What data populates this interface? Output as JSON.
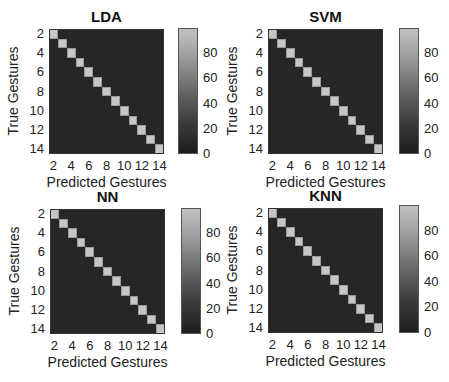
{
  "chart_data": [
    {
      "type": "heatmap",
      "title": "LDA",
      "xlabel": "Predicted Gestures",
      "ylabel": "True Gestures",
      "x_ticks": [
        "2",
        "4",
        "6",
        "8",
        "10",
        "12",
        "14"
      ],
      "y_ticks": [
        "2",
        "4",
        "6",
        "8",
        "10",
        "12",
        "14"
      ],
      "n_classes": 14,
      "diagonal_values": [
        100,
        100,
        100,
        100,
        100,
        100,
        100,
        100,
        100,
        100,
        100,
        100,
        100,
        100
      ],
      "off_diagonal_value": 0,
      "colorbar": {
        "ticks": [
          "0",
          "20",
          "40",
          "60",
          "80"
        ],
        "range": [
          0,
          100
        ]
      }
    },
    {
      "type": "heatmap",
      "title": "SVM",
      "xlabel": "Predicted Gestures",
      "ylabel": "True Gestures",
      "x_ticks": [
        "2",
        "4",
        "6",
        "8",
        "10",
        "12",
        "14"
      ],
      "y_ticks": [
        "2",
        "4",
        "6",
        "8",
        "10",
        "12",
        "14"
      ],
      "n_classes": 14,
      "diagonal_values": [
        100,
        100,
        100,
        100,
        100,
        100,
        100,
        100,
        100,
        100,
        100,
        100,
        100,
        100
      ],
      "off_diagonal_value": 0,
      "colorbar": {
        "ticks": [
          "0",
          "20",
          "40",
          "60",
          "80"
        ],
        "range": [
          0,
          100
        ]
      }
    },
    {
      "type": "heatmap",
      "title": "NN",
      "xlabel": "Predicted Gestures",
      "ylabel": "True Gestures",
      "x_ticks": [
        "2",
        "4",
        "6",
        "8",
        "10",
        "12",
        "14"
      ],
      "y_ticks": [
        "2",
        "4",
        "6",
        "8",
        "10",
        "12",
        "14"
      ],
      "n_classes": 14,
      "diagonal_values": [
        100,
        100,
        100,
        100,
        100,
        100,
        100,
        100,
        100,
        100,
        100,
        100,
        100,
        100
      ],
      "off_diagonal_value": 0,
      "colorbar": {
        "ticks": [
          "0",
          "20",
          "40",
          "60",
          "80"
        ],
        "range": [
          0,
          100
        ]
      }
    },
    {
      "type": "heatmap",
      "title": "KNN",
      "xlabel": "Predicted Gestures",
      "ylabel": "True Gestures",
      "x_ticks": [
        "2",
        "4",
        "6",
        "8",
        "10",
        "12",
        "14"
      ],
      "y_ticks": [
        "2",
        "4",
        "6",
        "8",
        "10",
        "12",
        "14"
      ],
      "n_classes": 14,
      "diagonal_values": [
        100,
        100,
        100,
        100,
        100,
        100,
        100,
        100,
        100,
        100,
        100,
        100,
        100,
        100
      ],
      "off_diagonal_value": 0,
      "colorbar": {
        "ticks": [
          "0",
          "20",
          "40",
          "60",
          "80"
        ],
        "range": [
          0,
          100
        ]
      }
    }
  ],
  "panels": [
    {
      "title": "LDA",
      "xlabel": "Predicted Gestures",
      "ylabel": "True Gestures"
    },
    {
      "title": "SVM",
      "xlabel": "Predicted Gestures",
      "ylabel": "True Gestures"
    },
    {
      "title": "NN",
      "xlabel": "Predicted Gestures",
      "ylabel": "True Gestures"
    },
    {
      "title": "KNN",
      "xlabel": "Predicted Gestures",
      "ylabel": "True Gestures"
    }
  ],
  "ticks": {
    "axis": [
      "2",
      "4",
      "6",
      "8",
      "10",
      "12",
      "14"
    ],
    "colorbar": [
      "0",
      "20",
      "40",
      "60",
      "80"
    ]
  },
  "colors": {
    "matrix_background": "#262626",
    "diagonal_cell": "#c6c6c6",
    "colorbar_low": "#1e1e1e",
    "colorbar_high": "#c2c2c2"
  }
}
